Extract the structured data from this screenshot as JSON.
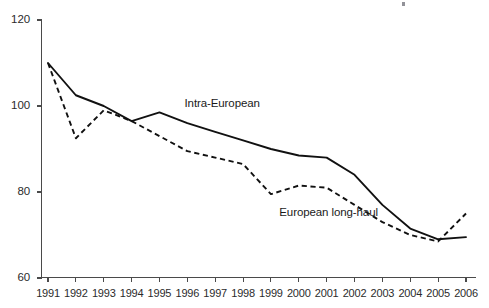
{
  "chart_data": {
    "type": "line",
    "title": "",
    "subtitle": "",
    "xlabel": "",
    "ylabel": "",
    "x": [
      1991,
      1992,
      1993,
      1994,
      1995,
      1996,
      1997,
      1998,
      1999,
      2000,
      2001,
      2002,
      2003,
      2004,
      2005,
      2006
    ],
    "categories": [
      "1991",
      "1992",
      "1993",
      "1994",
      "1995",
      "1996",
      "1997",
      "1998",
      "1999",
      "2000",
      "2001",
      "2002",
      "2003",
      "2004",
      "2005",
      "2006"
    ],
    "series": [
      {
        "name": "Intra-European",
        "style": "solid",
        "color": "#111111",
        "values": [
          110,
          102.5,
          100,
          96.5,
          98.5,
          96,
          94,
          92,
          90,
          88.5,
          88,
          84,
          77,
          71.5,
          69,
          69.5
        ]
      },
      {
        "name": "European long-haul",
        "style": "dashed",
        "color": "#111111",
        "values": [
          110,
          92.5,
          99,
          96.5,
          93,
          89.5,
          88,
          86.5,
          79.5,
          81.5,
          81,
          77,
          73,
          70,
          68.5,
          75
        ]
      }
    ],
    "xlim": [
      1991,
      2006
    ],
    "ylim": [
      60,
      120
    ],
    "ytick_values": [
      60,
      80,
      100,
      120
    ],
    "ytick_labels": [
      "60",
      "80",
      "100",
      "120"
    ],
    "grid": false,
    "legend_position": "inline-annotations",
    "annotations": [
      {
        "text": "Intra-European",
        "x": 1995.9,
        "y": 100.5
      },
      {
        "text": "European long-haul",
        "x": 1999.3,
        "y": 75.2
      }
    ]
  },
  "axes": {
    "y_labels": [
      "120",
      "100",
      "80",
      "60"
    ],
    "x_labels": [
      "1991",
      "1992",
      "1993",
      "1994",
      "1995",
      "1996",
      "1997",
      "1998",
      "1999",
      "2000",
      "2001",
      "2002",
      "2003",
      "2004",
      "2005",
      "2006"
    ]
  },
  "labels": {
    "intra_european": "Intra-European",
    "european_long_haul": "European long-haul"
  }
}
